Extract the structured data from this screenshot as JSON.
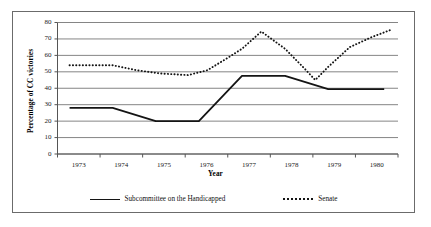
{
  "chart_data": {
    "type": "line",
    "title": "",
    "xlabel": "Year",
    "ylabel": "Percentage of CC victories",
    "categories": [
      "1973",
      "1974",
      "1975",
      "1976",
      "1977",
      "1978",
      "1979",
      "1980"
    ],
    "xlim": [
      1973,
      1980
    ],
    "ylim": [
      0,
      80
    ],
    "yticks": [
      0,
      10,
      20,
      30,
      40,
      50,
      60,
      70,
      80
    ],
    "grid": "horizontal",
    "legend_position": "bottom",
    "series": [
      {
        "name": "Subcommittee on the Handicapped",
        "style": "solid",
        "color": "#141414",
        "values": [
          28,
          28,
          20,
          20,
          47.5,
          47.5,
          39.5,
          39.5
        ]
      },
      {
        "name": "Senate",
        "style": "dotted",
        "color": "#141414",
        "values": [
          54,
          54,
          49,
          49,
          71,
          48,
          65,
          75.5
        ]
      }
    ],
    "senate_points": [
      {
        "x": 1973.0,
        "y": 54
      },
      {
        "x": 1974.0,
        "y": 54
      },
      {
        "x": 1974.55,
        "y": 51
      },
      {
        "x": 1975.1,
        "y": 49
      },
      {
        "x": 1975.75,
        "y": 48
      },
      {
        "x": 1976.2,
        "y": 51
      },
      {
        "x": 1976.7,
        "y": 59
      },
      {
        "x": 1977.0,
        "y": 64
      },
      {
        "x": 1977.45,
        "y": 74.5
      },
      {
        "x": 1978.0,
        "y": 64
      },
      {
        "x": 1978.45,
        "y": 52
      },
      {
        "x": 1978.7,
        "y": 45
      },
      {
        "x": 1979.0,
        "y": 53
      },
      {
        "x": 1979.5,
        "y": 65
      },
      {
        "x": 1980.0,
        "y": 71
      },
      {
        "x": 1980.45,
        "y": 75.5
      }
    ],
    "sub_points": [
      {
        "x": 1973.0,
        "y": 28
      },
      {
        "x": 1974.0,
        "y": 28
      },
      {
        "x": 1975.0,
        "y": 20
      },
      {
        "x": 1976.0,
        "y": 20
      },
      {
        "x": 1977.0,
        "y": 47.5
      },
      {
        "x": 1978.0,
        "y": 47.5
      },
      {
        "x": 1979.0,
        "y": 39.5
      },
      {
        "x": 1980.3,
        "y": 39.5
      }
    ]
  },
  "axes": {
    "y_tick_labels": [
      "80",
      "70",
      "60",
      "50",
      "40",
      "30",
      "20",
      "10",
      "0"
    ],
    "x_tick_labels": [
      "1973",
      "1974",
      "1975",
      "1976",
      "1977",
      "1978",
      "1979",
      "1980"
    ],
    "y_title": "Percentage of CC victories",
    "x_title": "Year"
  },
  "legend": {
    "entries": [
      {
        "label": "Subcommittee on the Handicapped",
        "style": "solid"
      },
      {
        "label": "Senate",
        "style": "dotted"
      }
    ]
  }
}
